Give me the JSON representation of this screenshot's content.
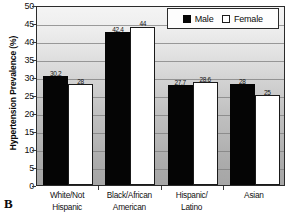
{
  "panel": {
    "letter": "B"
  },
  "chart_data": {
    "type": "bar",
    "title": "",
    "subtitle": "",
    "xlabel": "",
    "ylabel": "Hypertension Prevalence (%)",
    "ylim": [
      0,
      50
    ],
    "ytick_step": 5,
    "yticks": [
      "0",
      "5",
      "10",
      "15",
      "20",
      "25",
      "30",
      "35",
      "40",
      "45",
      "50"
    ],
    "grid": true,
    "grid_axis": "y",
    "legend_position": "top-right",
    "categories": [
      "White/Not Hispanic",
      "Black/African American",
      "Hispanic/Latino",
      "Asian"
    ],
    "category_lines": [
      [
        "White/Not",
        "Hispanic"
      ],
      [
        "Black/African",
        "American"
      ],
      [
        "Hispanic/",
        "Latino"
      ],
      [
        "Asian",
        ""
      ]
    ],
    "series": [
      {
        "name": "Male",
        "color": "#050505",
        "values": [
          30.2,
          42.4,
          27.7,
          28
        ],
        "labels": [
          "30.2",
          "42.4",
          "27.7",
          "28"
        ]
      },
      {
        "name": "Female",
        "color": "#ffffff",
        "values": [
          28,
          44,
          28.6,
          25
        ],
        "labels": [
          "28",
          "44",
          "28.6",
          "25"
        ]
      }
    ]
  },
  "legend": {
    "items": [
      {
        "label": "Male",
        "swatch": "filled-black-square"
      },
      {
        "label": "Female",
        "swatch": "outlined-white-square"
      }
    ]
  },
  "colors": {
    "male_bar": "#050505",
    "female_bar": "#ffffff",
    "axis": "#2b2b2b",
    "gridline": "#7d7d7d",
    "plot_background_top": "#f4f4f4",
    "plot_background_bottom": "#a6a6a6",
    "text": "#111111"
  }
}
